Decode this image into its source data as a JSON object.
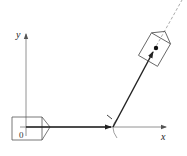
{
  "diagram": {
    "axes": {
      "x_label": "x",
      "y_label": "y",
      "origin_label": "0"
    },
    "colors": {
      "line": "#333333",
      "thin_line": "#777777",
      "background": "#ffffff"
    },
    "elements": [
      {
        "type": "axis",
        "name": "x-axis"
      },
      {
        "type": "axis",
        "name": "y-axis"
      },
      {
        "type": "vessel",
        "name": "initial-body",
        "position": "origin",
        "orientation": "along x"
      },
      {
        "type": "vector",
        "name": "first-displacement",
        "direction": "along x"
      },
      {
        "type": "angle-arc",
        "name": "turn-angle"
      },
      {
        "type": "vector",
        "name": "second-displacement",
        "direction": "upward-right"
      },
      {
        "type": "vessel",
        "name": "final-body",
        "orientation": "tilted",
        "has_center_dot": true
      },
      {
        "type": "dashed-line",
        "name": "heading-extension"
      }
    ]
  }
}
